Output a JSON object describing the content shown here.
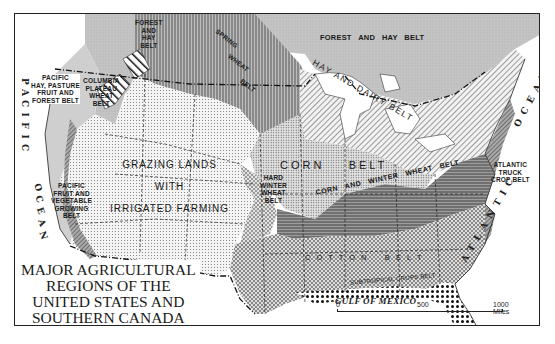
{
  "title": {
    "lines": [
      "MAJOR AGRICULTURAL",
      "REGIONS OF THE",
      "UNITED STATES AND",
      "SOUTHERN CANADA"
    ]
  },
  "regions": {
    "forest_hay_west": [
      "FOREST",
      "AND",
      "HAY",
      "BELT"
    ],
    "forest_hay_east": "FOREST   AND   HAY   BELT",
    "spring_wheat": [
      "SPRING",
      "WHEAT",
      "BELT"
    ],
    "pacific_hay": [
      "PACIFIC",
      "HAY, PASTURE",
      "FRUIT  AND",
      "FOREST  BELT"
    ],
    "columbia": [
      "COLUMBIA",
      "PLATEAU",
      "WHEAT",
      "BELT"
    ],
    "hay_dairy": [
      "HAY",
      "AND",
      "DAIRY",
      "BELT"
    ],
    "grazing": [
      "GRAZING LANDS",
      "WITH",
      "IRRIGATED FARMING"
    ],
    "corn_belt": [
      "CORN",
      "BELT"
    ],
    "hard_winter": [
      "HARD",
      "WINTER",
      "WHEAT",
      "BELT"
    ],
    "corn_winter": [
      "CORN",
      "AND",
      "WINTER",
      "WHEAT",
      "BELT"
    ],
    "pacific_fruit": [
      "PACIFIC",
      "FRUIT  AND",
      "VEGETABLE",
      "GROWING",
      "BELT"
    ],
    "atlantic_truck": [
      "ATLANTIC",
      "TRUCK",
      "CROP BELT"
    ],
    "cotton": "C O T T O N    B E L T",
    "subtropical": "SUBTROPICAL  CROPS  BELT"
  },
  "water": {
    "pacific_ocean": [
      "P",
      "A",
      "C",
      "I",
      "F",
      "I",
      "C"
    ],
    "pacific_ocean_2": [
      "O",
      "C",
      "E",
      "A",
      "N"
    ],
    "atlantic_ocean": "ATLANTIC",
    "atlantic_ocean_2": "OCEAN",
    "gulf": "GULF OF MEXICO"
  },
  "scale": {
    "labels": [
      "0",
      "500",
      "1000 Miles"
    ]
  },
  "colors": {
    "ink": "#1a1a1a",
    "paper": "#ffffff",
    "light_fill": "#cfcfcf",
    "mid_fill": "#9a9a9a"
  }
}
